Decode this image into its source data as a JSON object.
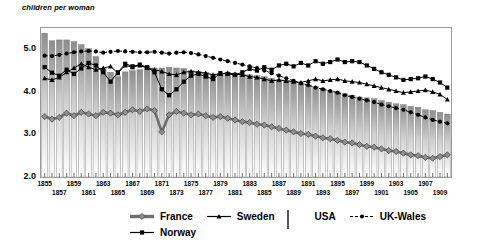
{
  "chart_data": {
    "type": "line",
    "title": "",
    "ylabel": "children per woman",
    "xlabel": "",
    "ylim": [
      2.0,
      5.5
    ],
    "yticks": [
      2.0,
      3.0,
      4.0,
      5.0
    ],
    "ytick_labels": [
      "2.0",
      "3.0",
      "4.0",
      "5.0"
    ],
    "grid": false,
    "legend_position": "bottom",
    "x": [
      1855,
      1856,
      1857,
      1858,
      1859,
      1860,
      1861,
      1862,
      1863,
      1864,
      1865,
      1866,
      1867,
      1868,
      1869,
      1870,
      1871,
      1872,
      1873,
      1874,
      1875,
      1876,
      1877,
      1878,
      1879,
      1880,
      1881,
      1882,
      1883,
      1884,
      1885,
      1886,
      1887,
      1888,
      1889,
      1890,
      1891,
      1892,
      1893,
      1894,
      1895,
      1896,
      1897,
      1898,
      1899,
      1900,
      1901,
      1902,
      1903,
      1904,
      1905,
      1906,
      1907,
      1908,
      1909,
      1910
    ],
    "xtick_labels": [
      "1855",
      "1857",
      "1859",
      "1861",
      "1863",
      "1865",
      "1867",
      "1869",
      "1871",
      "1873",
      "1875",
      "1877",
      "1879",
      "1881",
      "1883",
      "1885",
      "1887",
      "1889",
      "1891",
      "1893",
      "1895",
      "1897",
      "1899",
      "1901",
      "1903",
      "1905",
      "1907",
      "1909"
    ],
    "series": [
      {
        "name": "USA",
        "type": "bar",
        "values": [
          5.38,
          5.2,
          5.22,
          5.22,
          5.18,
          5.11,
          5.02,
          4.83,
          4.55,
          4.46,
          4.36,
          4.47,
          4.5,
          4.52,
          4.6,
          4.56,
          4.56,
          4.58,
          4.56,
          4.55,
          4.5,
          4.48,
          4.46,
          4.42,
          4.44,
          4.46,
          4.44,
          4.42,
          4.4,
          4.38,
          4.36,
          4.32,
          4.28,
          4.26,
          4.24,
          4.2,
          4.16,
          4.12,
          4.08,
          4.04,
          4.0,
          3.96,
          3.92,
          3.88,
          3.86,
          3.84,
          3.8,
          3.76,
          3.72,
          3.7,
          3.66,
          3.64,
          3.58,
          3.56,
          3.52,
          3.48
        ]
      },
      {
        "name": "UK-Wales",
        "type": "line-dashed-dot",
        "values": [
          4.85,
          4.84,
          4.87,
          4.9,
          4.93,
          4.95,
          4.96,
          4.95,
          4.92,
          4.94,
          4.96,
          4.95,
          4.94,
          4.93,
          4.93,
          4.94,
          4.92,
          4.9,
          4.92,
          4.93,
          4.91,
          4.88,
          4.84,
          4.8,
          4.76,
          4.72,
          4.68,
          4.64,
          4.6,
          4.56,
          4.5,
          4.44,
          4.38,
          4.32,
          4.26,
          4.2,
          4.16,
          4.1,
          4.06,
          4.02,
          3.98,
          3.92,
          3.88,
          3.84,
          3.8,
          3.76,
          3.7,
          3.66,
          3.62,
          3.58,
          3.52,
          3.46,
          3.4,
          3.34,
          3.3,
          3.26
        ]
      },
      {
        "name": "Norway",
        "type": "line-square",
        "values": [
          4.58,
          4.45,
          4.38,
          4.52,
          4.42,
          4.55,
          4.68,
          4.62,
          4.46,
          4.24,
          4.46,
          4.66,
          4.6,
          4.64,
          4.58,
          4.46,
          4.06,
          3.92,
          4.06,
          4.24,
          4.38,
          4.42,
          4.36,
          4.3,
          4.44,
          4.42,
          4.4,
          4.46,
          4.54,
          4.5,
          4.58,
          4.52,
          4.62,
          4.66,
          4.6,
          4.68,
          4.62,
          4.72,
          4.66,
          4.7,
          4.76,
          4.7,
          4.72,
          4.7,
          4.62,
          4.54,
          4.46,
          4.4,
          4.34,
          4.28,
          4.3,
          4.32,
          4.36,
          4.3,
          4.22,
          4.1
        ]
      },
      {
        "name": "Sweden",
        "type": "line-triangle",
        "values": [
          4.32,
          4.28,
          4.34,
          4.46,
          4.56,
          4.66,
          4.58,
          4.52,
          4.56,
          4.6,
          4.44,
          4.62,
          4.58,
          4.62,
          4.56,
          4.52,
          4.48,
          4.42,
          4.4,
          4.46,
          4.48,
          4.46,
          4.44,
          4.4,
          4.42,
          4.44,
          4.42,
          4.4,
          4.36,
          4.34,
          4.3,
          4.26,
          4.28,
          4.26,
          4.24,
          4.22,
          4.26,
          4.3,
          4.26,
          4.28,
          4.3,
          4.26,
          4.24,
          4.22,
          4.18,
          4.14,
          4.1,
          4.06,
          4.02,
          3.98,
          4.0,
          4.02,
          4.04,
          4.0,
          3.94,
          3.82
        ]
      },
      {
        "name": "France",
        "type": "line-diamond",
        "values": [
          3.42,
          3.36,
          3.4,
          3.5,
          3.44,
          3.52,
          3.48,
          3.44,
          3.52,
          3.5,
          3.46,
          3.52,
          3.58,
          3.54,
          3.6,
          3.56,
          3.06,
          3.46,
          3.54,
          3.5,
          3.46,
          3.48,
          3.44,
          3.4,
          3.42,
          3.38,
          3.34,
          3.3,
          3.28,
          3.24,
          3.22,
          3.18,
          3.14,
          3.1,
          3.06,
          3.02,
          3.0,
          2.96,
          2.92,
          2.9,
          2.86,
          2.82,
          2.8,
          2.76,
          2.72,
          2.7,
          2.66,
          2.62,
          2.6,
          2.56,
          2.52,
          2.5,
          2.46,
          2.44,
          2.48,
          2.52
        ]
      }
    ],
    "legend": [
      {
        "label": "France",
        "marker": "diamond",
        "style": "thick-gray-line"
      },
      {
        "label": "Sweden",
        "marker": "triangle",
        "style": "thin-black-line"
      },
      {
        "label": "USA",
        "marker": "box",
        "style": "gradient-bar"
      },
      {
        "label": "UK-Wales",
        "marker": "dot",
        "style": "dashed-black-line"
      },
      {
        "label": "Norway",
        "marker": "square",
        "style": "thin-black-line"
      }
    ],
    "colors": {
      "france": "#6e6e6e",
      "sweden": "#000000",
      "norway": "#000000",
      "uk_wales": "#000000",
      "usa_bar_top": "#8d8d8d",
      "usa_bar_bottom": "#ffffff",
      "frame": "#9a9a9a"
    }
  }
}
